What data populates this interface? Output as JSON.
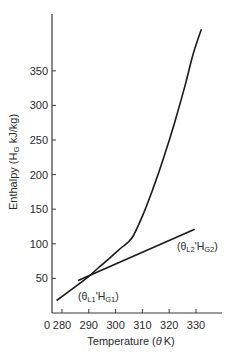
{
  "chart_data": {
    "type": "line",
    "title": "",
    "xlabel": "Temperature (θK)",
    "ylabel": "Enthalpy (H_G kJ/kg)",
    "x_ticks": [
      280,
      290,
      300,
      310,
      320,
      330
    ],
    "x_origin_label": "0",
    "y_ticks": [
      50,
      100,
      150,
      200,
      250,
      300,
      350
    ],
    "xlim": [
      276,
      340
    ],
    "ylim": [
      0,
      430
    ],
    "grid": false,
    "legend": null,
    "series": [
      {
        "name": "Saturation enthalpy curve",
        "x": [
          278,
          285,
          290,
          293.5,
          298,
          302,
          306,
          310,
          314,
          318,
          322,
          326,
          329,
          332
        ],
        "y": [
          18,
          38,
          53,
          65,
          80,
          94,
          108,
          140,
          180,
          225,
          275,
          330,
          375,
          410
        ]
      },
      {
        "name": "Operating line",
        "x": [
          286,
          329.5
        ],
        "y": [
          47,
          121
        ]
      }
    ],
    "annotations": [
      {
        "text_main": "(θ",
        "sub1": "L1",
        "mid": "'H",
        "sub2": "G1",
        "end": ")",
        "x": 286,
        "y": 25
      },
      {
        "text_main": "(θ",
        "sub1": "L2",
        "mid": "'H",
        "sub2": "G2",
        "end": ")",
        "x": 318,
        "y": 100
      }
    ]
  },
  "labels": {
    "y_axis_title": "Enthalpy (H",
    "y_axis_sub": "G",
    "y_axis_tail": " kJ/kg)",
    "x_axis_title_pre": "Temperature (",
    "x_axis_theta": "θ",
    "x_axis_title_post": "K)",
    "x_origin": "0",
    "x_tick_labels": [
      "280",
      "290",
      "300",
      "310",
      "320",
      "330"
    ],
    "y_tick_labels": [
      "50",
      "100",
      "150",
      "200",
      "250",
      "300",
      "350"
    ],
    "annot1": {
      "open": "(θ",
      "sub_a": "L1",
      "mid": "'H",
      "sub_b": "G1",
      "close": ")"
    },
    "annot2": {
      "open": "(θ",
      "sub_a": "L2",
      "mid": "'H",
      "sub_b": "G2",
      "close": ")"
    }
  },
  "colors": {
    "line": "#1a1a1a",
    "axis": "#3a3a3a",
    "text": "#2a2a2a"
  }
}
